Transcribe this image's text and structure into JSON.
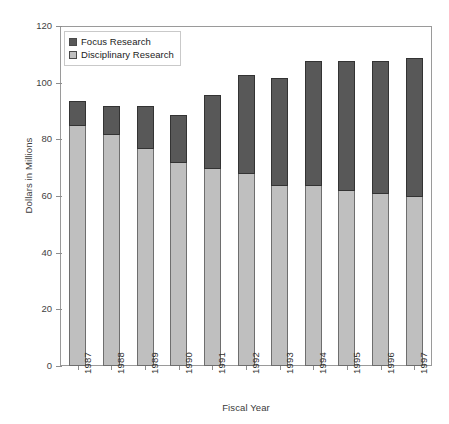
{
  "chart_data": {
    "type": "bar",
    "stacked": true,
    "title": "",
    "xlabel": "Fiscal Year",
    "ylabel": "Dollars in Millions",
    "categories": [
      "1987",
      "1988",
      "1989",
      "1990",
      "1991",
      "1992",
      "1993",
      "1994",
      "1995",
      "1996",
      "1997"
    ],
    "series": [
      {
        "name": "Focus Research",
        "color": "#585858",
        "values": [
          9,
          10,
          15,
          17,
          26,
          35,
          38,
          44,
          46,
          47,
          49
        ]
      },
      {
        "name": "Disciplinary Research",
        "color": "#bfbfbf",
        "values": [
          85,
          82,
          77,
          72,
          70,
          68,
          64,
          64,
          62,
          61,
          60
        ]
      }
    ],
    "totals": [
      94,
      92,
      92,
      89,
      96,
      103,
      102,
      108,
      108,
      108,
      109
    ],
    "ylim": [
      0,
      120
    ],
    "yticks": [
      0,
      20,
      40,
      60,
      80,
      100,
      120
    ],
    "ytick_labels": [
      "0",
      "20",
      "40",
      "60",
      "80",
      "100",
      "120"
    ],
    "grid": false,
    "legend_position": "top-left"
  },
  "legend": {
    "items": [
      {
        "label": "Focus Research",
        "color": "#585858"
      },
      {
        "label": "Disciplinary Research",
        "color": "#bfbfbf"
      }
    ]
  }
}
